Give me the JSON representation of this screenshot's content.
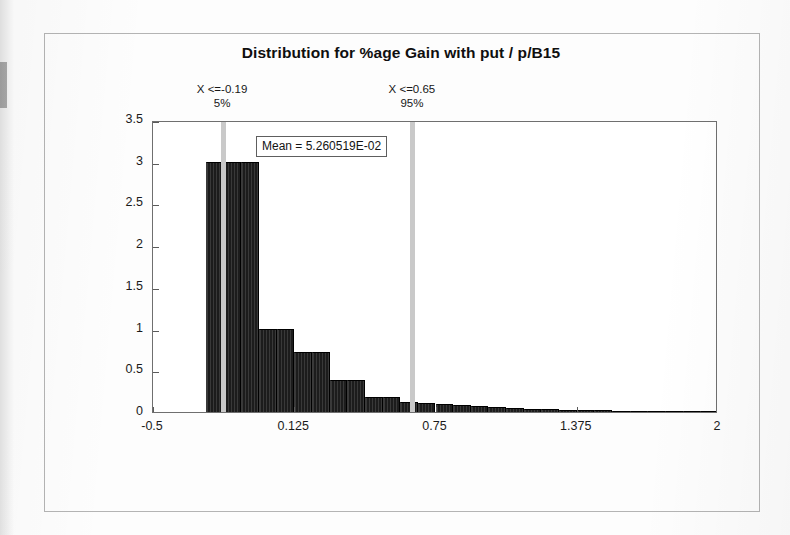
{
  "figure": {
    "title": "Distribution for %age Gain with put / p/B15",
    "mean_label": "Mean = 5.260519E-02"
  },
  "annotations": [
    {
      "name": "lower-percentile",
      "x_text": "X <=-0.19",
      "pct_text": "5%",
      "x_value": -0.19,
      "percentile": 5
    },
    {
      "name": "upper-percentile",
      "x_text": "X <=0.65",
      "pct_text": "95%",
      "x_value": 0.65,
      "percentile": 95
    }
  ],
  "axes": {
    "y_ticks": [
      "0",
      "0.5",
      "1",
      "1.5",
      "2",
      "2.5",
      "3",
      "3.5"
    ],
    "x_ticks": [
      "-0.5",
      "0.125",
      "0.75",
      "1.375",
      "2"
    ]
  },
  "colors": {
    "bar": "#1c1c1c",
    "marker_line": "#c9c9c9",
    "plot_frame": "#6f6f6f",
    "outer_frame": "#b4b4b4",
    "text": "#141414"
  },
  "chart_data": {
    "type": "bar",
    "title": "Distribution for %age Gain with put / p/B15",
    "xlabel": "",
    "ylabel": "",
    "xlim": [
      -0.5,
      2
    ],
    "ylim": [
      0,
      3.5
    ],
    "grid": false,
    "legend": null,
    "x_tick_values": [
      -0.5,
      0.125,
      0.75,
      1.375,
      2
    ],
    "y_tick_values": [
      0,
      0.5,
      1,
      1.5,
      2,
      2.5,
      3,
      3.5
    ],
    "bin_width": 0.0781,
    "bin_left_edges": [
      -0.2656,
      -0.1875,
      -0.1094,
      -0.0313,
      0.0469,
      0.125,
      0.2031,
      0.2813,
      0.3594,
      0.4375,
      0.5156,
      0.5938,
      0.6719,
      0.75,
      0.8281,
      0.9063,
      0.9844,
      1.0625,
      1.1406,
      1.2188,
      1.2969,
      1.375,
      1.4531,
      1.5313,
      1.6094,
      1.6875,
      1.7656,
      1.8438,
      1.9219
    ],
    "values": [
      3.0,
      3.0,
      3.0,
      1.0,
      1.0,
      0.72,
      0.72,
      0.38,
      0.38,
      0.18,
      0.18,
      0.12,
      0.11,
      0.1,
      0.09,
      0.07,
      0.06,
      0.05,
      0.04,
      0.035,
      0.03,
      0.025,
      0.02,
      0.018,
      0.015,
      0.012,
      0.01,
      0.008,
      0.006
    ],
    "annotations": [
      {
        "label": "X <=-0.19  5%",
        "x": -0.19,
        "kind": "vline"
      },
      {
        "label": "X <=0.65  95%",
        "x": 0.65,
        "kind": "vline"
      },
      {
        "label": "Mean = 5.260519E-02",
        "value": 0.05260519,
        "kind": "textbox"
      }
    ]
  }
}
